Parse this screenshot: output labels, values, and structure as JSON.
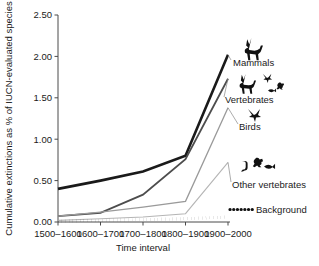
{
  "chart_data": {
    "type": "line",
    "title": "",
    "xlabel": "Time interval",
    "ylabel": "Cumulative extinctions as % of IUCN-evaluated species",
    "categories": [
      "1500–1600",
      "1600–1700",
      "1700–1800",
      "1800–1900",
      "1900–2000"
    ],
    "ylim": [
      0.0,
      2.5
    ],
    "ytick_labels": [
      "0.00",
      "0.50",
      "1.00",
      "1.50",
      "2.00",
      "2.50"
    ],
    "ytick_values": [
      0.0,
      0.5,
      1.0,
      1.5,
      2.0,
      2.5
    ],
    "grid": false,
    "legend_position": "right-inline-annotations",
    "series": [
      {
        "name": "Mammals",
        "label": "Mammals",
        "icon": "deer-silhouette-icon",
        "color": "#1a1a1a",
        "width": 2.6,
        "style": "solid",
        "values": [
          0.4,
          0.5,
          0.61,
          0.8,
          2.02
        ]
      },
      {
        "name": "Vertebrates",
        "label": "Vertebrates",
        "icon": "vertebrates-group-silhouette-icon",
        "color": "#4d4d4d",
        "width": 1.8,
        "style": "solid",
        "values": [
          0.07,
          0.11,
          0.33,
          0.76,
          1.73
        ]
      },
      {
        "name": "Birds",
        "label": "Birds",
        "icon": "bird-silhouette-icon",
        "color": "#9a9a9a",
        "width": 1.3,
        "style": "solid",
        "values": [
          0.07,
          0.12,
          0.18,
          0.25,
          1.38
        ]
      },
      {
        "name": "Other vertebrates",
        "label": "Other vertebrates",
        "icon": "reptile-frog-fish-silhouette-icon",
        "color": "#b5b5b5",
        "width": 1.1,
        "style": "solid",
        "values": [
          0.02,
          0.04,
          0.06,
          0.1,
          0.72
        ]
      },
      {
        "name": "Background",
        "label": "Background",
        "icon": "dotted-line-icon",
        "color": "#111111",
        "width": 2.6,
        "style": "dotted",
        "values": [
          0.01,
          0.02,
          0.03,
          0.04,
          0.06
        ]
      }
    ]
  }
}
